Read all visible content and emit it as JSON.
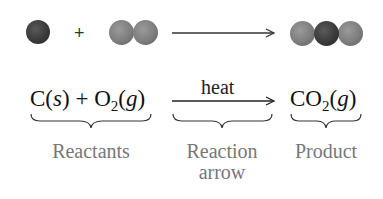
{
  "molecular_row": {
    "reactant_1": {
      "atoms": [
        "C"
      ],
      "name": "carbon-atom"
    },
    "plus": "+",
    "reactant_2": {
      "atoms": [
        "O",
        "O"
      ],
      "name": "oxygen-molecule"
    },
    "product": {
      "atoms": [
        "O",
        "C",
        "O"
      ],
      "name": "carbon-dioxide-molecule"
    },
    "colors": {
      "carbon": "#333333",
      "oxygen": "#7d7d7d"
    }
  },
  "equation": {
    "reactant_1": {
      "symbol": "C",
      "state": "s"
    },
    "plus": "+",
    "reactant_2": {
      "symbol": "O",
      "subscript": "2",
      "state": "g"
    },
    "condition": "heat",
    "product": {
      "symbol": "CO",
      "subscript": "2",
      "state": "g"
    }
  },
  "labels": {
    "reactants": "Reactants",
    "reaction_arrow_line1": "Reaction",
    "reaction_arrow_line2": "arrow",
    "product": "Product"
  }
}
